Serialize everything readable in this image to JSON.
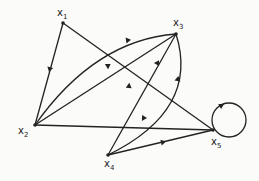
{
  "diagram": {
    "type": "directed-graph",
    "nodes": [
      {
        "id": "x1",
        "label": "x",
        "sub": "1",
        "x": 63,
        "y": 23
      },
      {
        "id": "x2",
        "label": "x",
        "sub": "2",
        "x": 35,
        "y": 125
      },
      {
        "id": "x3",
        "label": "x",
        "sub": "3",
        "x": 176,
        "y": 34
      },
      {
        "id": "x4",
        "label": "x",
        "sub": "4",
        "x": 108,
        "y": 155
      },
      {
        "id": "x5",
        "label": "x",
        "sub": "5",
        "x": 213,
        "y": 130
      }
    ],
    "edges": [
      {
        "from": "x1",
        "to": "x2",
        "shape": "straight"
      },
      {
        "from": "x1",
        "to": "x5",
        "shape": "straight"
      },
      {
        "from": "x2",
        "to": "x3",
        "shape": "curved"
      },
      {
        "from": "x3",
        "to": "x2",
        "shape": "straight"
      },
      {
        "from": "x2",
        "to": "x5",
        "shape": "straight"
      },
      {
        "from": "x4",
        "to": "x3",
        "shape": "straight"
      },
      {
        "from": "x4",
        "to": "x3",
        "shape": "curved"
      },
      {
        "from": "x4",
        "to": "x5",
        "shape": "straight"
      },
      {
        "from": "x5",
        "to": "x5",
        "shape": "self-loop"
      }
    ],
    "colors": {
      "line": "#222222",
      "background": "#fbfbfa"
    }
  }
}
